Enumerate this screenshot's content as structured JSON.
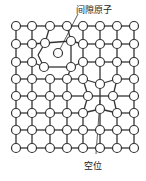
{
  "labels": {
    "interstitial": "间隙原子",
    "vacancy": "空位"
  },
  "colors": {
    "line": "#333333",
    "atom_fill": "#ffffff",
    "atom_stroke": "#333333",
    "background": "#ffffff"
  },
  "grid": {
    "cols_x": [
      16,
      32,
      50,
      67,
      83,
      100,
      117,
      134
    ],
    "rows_y": [
      26,
      44,
      62,
      79,
      96,
      113,
      130,
      148
    ],
    "atom_radius": 4.5
  },
  "displaced_atoms": [
    {
      "row": 1,
      "col": 2,
      "x": 45,
      "y": 43
    },
    {
      "row": 1,
      "col": 3,
      "x": 71,
      "y": 41
    },
    {
      "row": 2,
      "col": 2,
      "x": 44,
      "y": 67
    },
    {
      "row": 2,
      "col": 3,
      "x": 71,
      "y": 67
    },
    {
      "row": 4,
      "col": 4,
      "x": 88,
      "y": 96
    },
    {
      "row": 4,
      "col": 6,
      "x": 113,
      "y": 96
    },
    {
      "row": 3,
      "col": 5,
      "x": 100,
      "y": 84
    },
    {
      "row": 5,
      "col": 5,
      "x": 100,
      "y": 109
    }
  ],
  "interstitial_atom": {
    "x": 58,
    "y": 53
  },
  "vacancy_site": {
    "row": 4,
    "col": 5
  },
  "leaders": {
    "interstitial": {
      "x1": 78,
      "y1": 14,
      "x2": 60,
      "y2": 49
    },
    "vacancy": {
      "x1": 96,
      "y1": 154,
      "x2": 100,
      "y2": 100
    }
  }
}
